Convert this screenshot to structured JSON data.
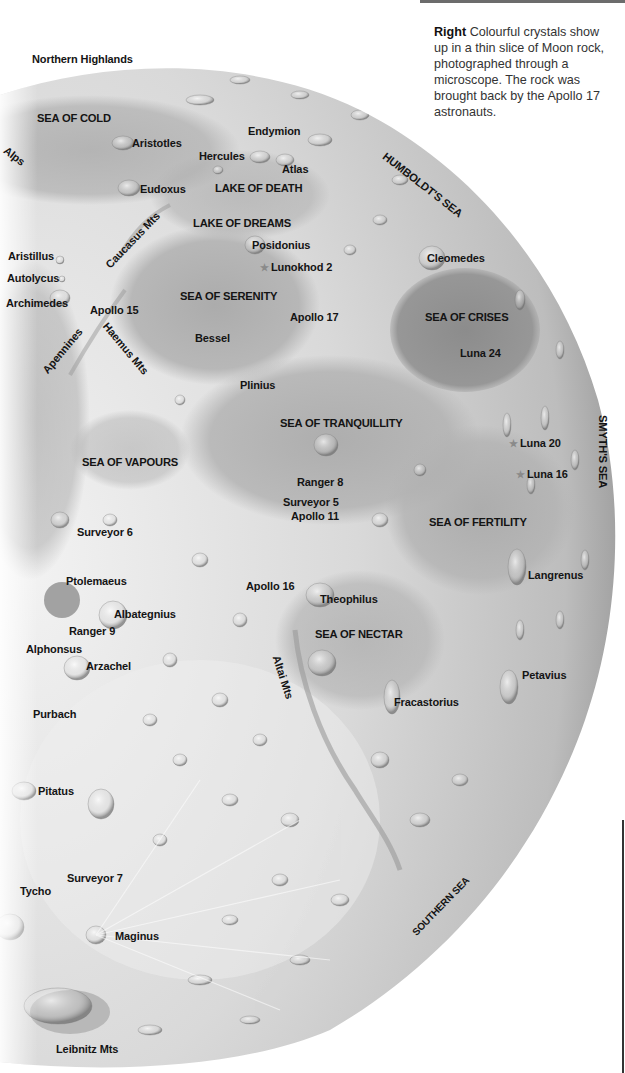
{
  "caption": {
    "lead": "Right",
    "text": "Colourful crystals show up in a thin slice of Moon rock, photographed through a microscope. The rock was brought back by the Apollo 17 astronauts."
  },
  "map": {
    "title_regions": {
      "northern_highlands": "Northern Highlands",
      "sea_of_cold": "SEA OF COLD",
      "alps": "Alps",
      "aristotles": "Aristotles",
      "endymion": "Endymion",
      "hercules": "Hercules",
      "atlas": "Atlas",
      "humboldts_sea": "HUMBOLDT'S SEA",
      "eudoxus": "Eudoxus",
      "lake_of_death": "LAKE OF DEATH",
      "lake_of_dreams": "LAKE OF DREAMS",
      "caucasus_mts": "Caucasus Mts",
      "posidonius": "Posidonius",
      "aristillus": "Aristillus",
      "lunokhod_2": "Lunokhod 2",
      "cleomedes": "Cleomedes",
      "autolycus": "Autolycus",
      "archimedes": "Archimedes",
      "apollo_15": "Apollo 15",
      "sea_of_serenity": "SEA OF SERENITY",
      "apollo_17": "Apollo 17",
      "sea_of_crises": "SEA OF CRISES",
      "apennines": "Apennines",
      "haemus_mts": "Haemus Mts",
      "bessel": "Bessel",
      "luna_24": "Luna 24",
      "plinius": "Plinius",
      "sea_of_tranquillity": "SEA OF TRANQUILLITY",
      "smyths_sea": "SMYTH'S SEA",
      "luna_20": "Luna 20",
      "sea_of_vapours": "SEA OF VAPOURS",
      "ranger_8": "Ranger 8",
      "luna_16": "Luna 16",
      "surveyor_5": "Surveyor 5",
      "apollo_11": "Apollo 11",
      "sea_of_fertility": "SEA OF FERTILITY",
      "surveyor_6": "Surveyor 6",
      "langrenus": "Langrenus",
      "ptolemaeus": "Ptolemaeus",
      "apollo_16": "Apollo 16",
      "theophilus": "Theophilus",
      "albategnius": "Albategnius",
      "ranger_9": "Ranger 9",
      "sea_of_nectar": "SEA OF NECTAR",
      "alphonsus": "Alphonsus",
      "arzachel": "Arzachel",
      "altai_mts": "Altai Mts",
      "petavius": "Petavius",
      "fracastorius": "Fracastorius",
      "purbach": "Purbach",
      "pitatus": "Pitatus",
      "surveyor_7": "Surveyor 7",
      "tycho": "Tycho",
      "southern_sea": "SOUTHERN SEA",
      "maginus": "Maginus",
      "leibnitz_mts": "Leibnitz Mts"
    },
    "landing_marker_icon": "star-icon",
    "colors": {
      "surface_light": "#e6e6e6",
      "surface_mid": "#c4c4c4",
      "maria_dark": "#a9a9a9",
      "crises_dark": "#8f8f8f",
      "label_text": "#141414",
      "marker_star": "#8a8a8a"
    }
  }
}
